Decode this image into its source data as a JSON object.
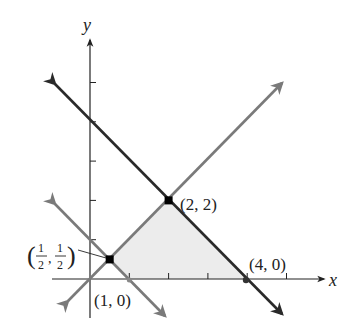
{
  "axes": {
    "x_label": "x",
    "y_label": "y"
  },
  "colors": {
    "dark_line": "#2a2a2a",
    "light_line": "#7a7a7a",
    "region_fill": "#ececec",
    "axis": "#222222"
  },
  "points": [
    {
      "name": "A",
      "label": "(2, 2)",
      "x": 2,
      "y": 2,
      "marker": true
    },
    {
      "name": "B",
      "label": "(4, 0)",
      "x": 4,
      "y": 0,
      "marker": true
    },
    {
      "name": "C",
      "label": "(1, 0)",
      "x": 1,
      "y": 0,
      "marker": false
    },
    {
      "name": "D",
      "label_num": "1",
      "label_den": "2",
      "x": 0.5,
      "y": 0.5,
      "marker": true
    }
  ],
  "labels": {
    "p22": "(2, 2)",
    "p40": "(4, 0)",
    "p10": "(1, 0)",
    "half_num": "1",
    "half_den": "2",
    "half_comma": ","
  },
  "lines": [
    {
      "name": "x+y=4",
      "style": "dark"
    },
    {
      "name": "y=x",
      "style": "light"
    },
    {
      "name": "x+y=1",
      "style": "light"
    }
  ],
  "region": {
    "vertices": [
      [
        0.5,
        0.5
      ],
      [
        2,
        2
      ],
      [
        4,
        0
      ],
      [
        1,
        0
      ]
    ],
    "description": "Shaded feasible region"
  }
}
